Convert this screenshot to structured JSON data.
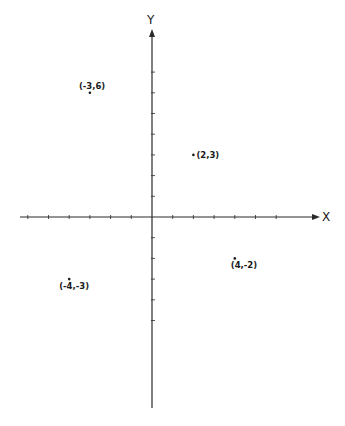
{
  "chart_data": {
    "type": "scatter",
    "title": "",
    "xlabel": "X",
    "ylabel": "Y",
    "xlim": [
      -6,
      8
    ],
    "ylim": [
      -9,
      9
    ],
    "grid": false,
    "axes_style": "cartesian-cross-through-origin",
    "x_ticks": [
      -6,
      -5,
      -4,
      -3,
      -2,
      -1,
      1,
      2,
      3,
      4,
      5,
      6
    ],
    "y_ticks": [
      -5,
      -4,
      -3,
      -2,
      -1,
      1,
      2,
      3,
      4,
      5,
      6,
      7
    ],
    "tick_labels_shown": false,
    "points": [
      {
        "x": -3,
        "y": 6,
        "label": "(-3,6)"
      },
      {
        "x": 2,
        "y": 3,
        "label": "(2,3)"
      },
      {
        "x": -4,
        "y": -3,
        "label": "(-4,-3)"
      },
      {
        "x": 4,
        "y": -2,
        "label": "(4,-2)"
      }
    ]
  },
  "colors": {
    "background": "#ffffff",
    "ink": "#1a1a1a"
  }
}
